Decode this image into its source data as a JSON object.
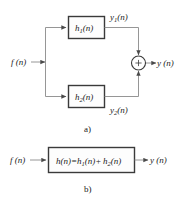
{
  "figure": {
    "part_a": {
      "caption": "a)",
      "input_label": "f (n)",
      "block_top_label_base": "h",
      "block_top_label_sub": "1",
      "block_top_label_tail": "(n)",
      "block_bottom_label_base": "h",
      "block_bottom_label_sub": "2",
      "block_bottom_label_tail": "(n)",
      "signal_top_label_base": "y",
      "signal_top_label_sub": "1",
      "signal_top_label_tail": "(n)",
      "signal_bottom_label_base": "y",
      "signal_bottom_label_sub": "2",
      "signal_bottom_label_tail": "(n)",
      "adder_symbol": "+",
      "output_label": "y (n)"
    },
    "part_b": {
      "caption": "b)",
      "input_label": "f (n)",
      "block_label_base": "h",
      "block_label_eq": "(n)=",
      "block_label_h1": "h",
      "block_label_h1_sub": "1",
      "block_label_h1_tail": "(n)+",
      "block_label_h2": "h",
      "block_label_h2_sub": "2",
      "block_label_h2_tail": "(n)",
      "output_label": "y (n)"
    },
    "colors": {
      "wire": "#8a8a8a",
      "block_border": "#3a3a3a",
      "text": "#1a1a1a",
      "background": "#ffffff"
    }
  }
}
